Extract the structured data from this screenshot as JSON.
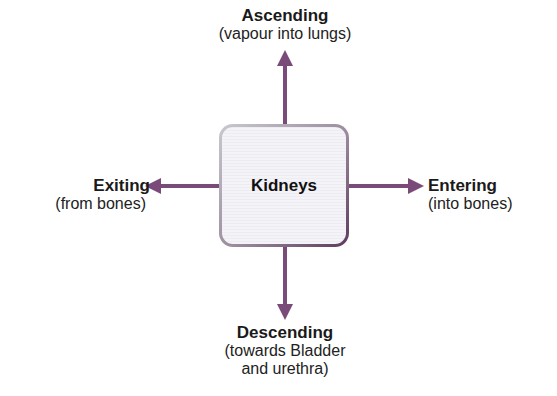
{
  "center": {
    "label": "Kidneys"
  },
  "directions": {
    "up": {
      "title": "Ascending",
      "sub": [
        "(vapour into lungs)"
      ]
    },
    "left": {
      "title": "Exiting",
      "sub": [
        "(from bones)"
      ]
    },
    "right": {
      "title": "Entering",
      "sub": [
        "(into bones)"
      ]
    },
    "down": {
      "title": "Descending",
      "sub": [
        "(towards Bladder",
        "and urethra)"
      ]
    }
  },
  "colors": {
    "arrow": "#7a4a78",
    "box_border_dark": "#5d3a5c",
    "box_fill": "#f1f1f5"
  }
}
